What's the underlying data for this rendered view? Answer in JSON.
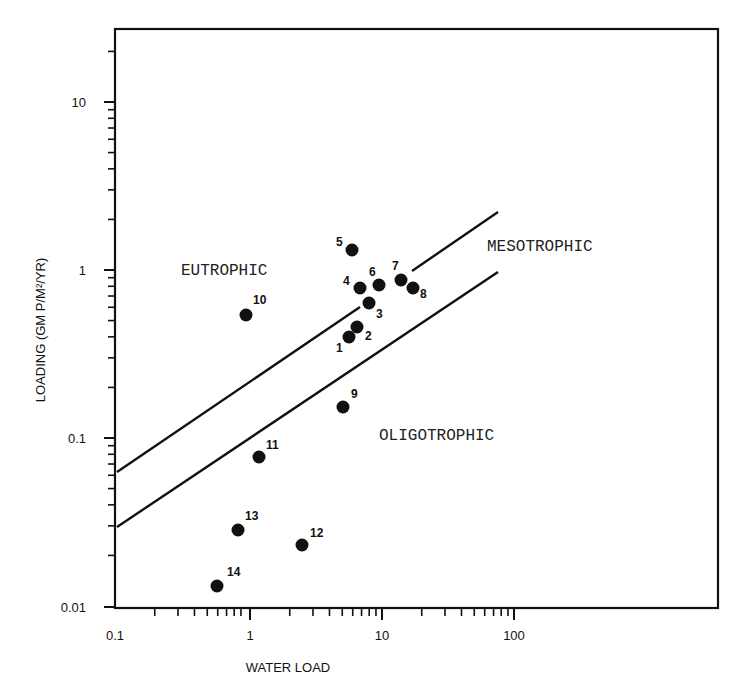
{
  "chart_data": {
    "type": "scatter",
    "title": "",
    "xlabel": "WATER LOAD",
    "ylabel": "LOADING (GM P/M²/YR)",
    "xscale": "log",
    "yscale": "log",
    "xlim": [
      0.1,
      400
    ],
    "ylim": [
      0.01,
      30
    ],
    "x_ticks": [
      "0.1",
      "1",
      "10",
      "100"
    ],
    "y_ticks": [
      "0.01",
      "0.1",
      "1",
      "10"
    ],
    "grid": false,
    "legend": null,
    "series": [
      {
        "name": "lakes",
        "marker": "filled-circle",
        "points": [
          {
            "label": "1",
            "x": 5.6,
            "y": 0.4
          },
          {
            "label": "2",
            "x": 6.5,
            "y": 0.46
          },
          {
            "label": "3",
            "x": 8.0,
            "y": 0.64
          },
          {
            "label": "4",
            "x": 6.8,
            "y": 0.78
          },
          {
            "label": "5",
            "x": 5.9,
            "y": 1.3
          },
          {
            "label": "6",
            "x": 9.5,
            "y": 0.81
          },
          {
            "label": "7",
            "x": 14,
            "y": 0.87
          },
          {
            "label": "8",
            "x": 17,
            "y": 0.78
          },
          {
            "label": "9",
            "x": 5.0,
            "y": 0.15
          },
          {
            "label": "10",
            "x": 0.93,
            "y": 0.54
          },
          {
            "label": "11",
            "x": 1.17,
            "y": 0.077
          },
          {
            "label": "12",
            "x": 2.5,
            "y": 0.023
          },
          {
            "label": "13",
            "x": 0.81,
            "y": 0.028
          },
          {
            "label": "14",
            "x": 0.4,
            "y": 0.014
          }
        ]
      }
    ],
    "boundary_lines": [
      {
        "name": "eutrophic-mesotrophic boundary",
        "from": {
          "x": 0.1,
          "y": 0.065
        },
        "to": {
          "x": 76,
          "y": 2.2
        }
      },
      {
        "name": "mesotrophic-oligotrophic boundary",
        "from": {
          "x": 0.1,
          "y": 0.03
        },
        "to": {
          "x": 76,
          "y": 1.0
        }
      }
    ],
    "annotations": [
      "EUTROPHIC",
      "MESOTROPHIC",
      "OLIGOTROPHIC"
    ]
  },
  "labels": {
    "x_axis": "WATER LOAD",
    "y_axis": "LOADING (GM P/M²/YR)",
    "eutrophic": "EUTROPHIC",
    "mesotrophic": "MESOTROPHIC",
    "oligotrophic": "OLIGOTROPHIC",
    "xt0": "0.1",
    "xt1": "1",
    "xt2": "10",
    "xt3": "100",
    "yt0": "0.01",
    "yt1": "0.1",
    "yt2": "1",
    "yt3": "10"
  },
  "points_px": [
    {
      "label": "1",
      "cx": 349,
      "cy": 337,
      "lx": 336,
      "ly": 352
    },
    {
      "label": "2",
      "cx": 357,
      "cy": 327,
      "lx": 365,
      "ly": 340
    },
    {
      "label": "3",
      "cx": 369,
      "cy": 303,
      "lx": 376,
      "ly": 318
    },
    {
      "label": "4",
      "cx": 360,
      "cy": 288,
      "lx": 343,
      "ly": 285
    },
    {
      "label": "5",
      "cx": 352,
      "cy": 250,
      "lx": 336,
      "ly": 246
    },
    {
      "label": "6",
      "cx": 379,
      "cy": 285,
      "lx": 369,
      "ly": 276
    },
    {
      "label": "7",
      "cx": 401,
      "cy": 280,
      "lx": 392,
      "ly": 270
    },
    {
      "label": "8",
      "cx": 413,
      "cy": 288,
      "lx": 420,
      "ly": 298
    },
    {
      "label": "9",
      "cx": 343,
      "cy": 407,
      "lx": 351,
      "ly": 398
    },
    {
      "label": "10",
      "cx": 246,
      "cy": 315,
      "lx": 253,
      "ly": 304
    },
    {
      "label": "11",
      "cx": 259,
      "cy": 457,
      "lx": 266,
      "ly": 449
    },
    {
      "label": "12",
      "cx": 302,
      "cy": 545,
      "lx": 310,
      "ly": 537
    },
    {
      "label": "13",
      "cx": 238,
      "cy": 530,
      "lx": 245,
      "ly": 520
    },
    {
      "label": "14",
      "cx": 217,
      "cy": 586,
      "lx": 227,
      "ly": 576
    }
  ]
}
